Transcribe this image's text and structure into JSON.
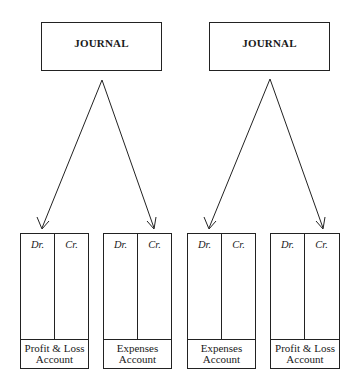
{
  "diagrams": [
    {
      "journal": {
        "label": "JOURNAL"
      },
      "accounts": [
        {
          "dr": "Dr.",
          "cr": "Cr.",
          "line1": "Profit & Loss",
          "line2": "Account"
        },
        {
          "dr": "Dr.",
          "cr": "Cr.",
          "line1": "Expenses",
          "line2": "Account"
        }
      ]
    },
    {
      "journal": {
        "label": "JOURNAL"
      },
      "accounts": [
        {
          "dr": "Dr.",
          "cr": "Cr.",
          "line1": "Expenses",
          "line2": "Account"
        },
        {
          "dr": "Dr.",
          "cr": "Cr.",
          "line1": "Profit & Loss",
          "line2": "Account"
        }
      ]
    }
  ]
}
